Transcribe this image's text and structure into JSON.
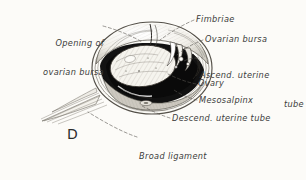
{
  "figure": {
    "letter": "D",
    "caption_subject": "ovarian bursa dissection",
    "background_color": "#fcfbf8",
    "ink_color": "#3b3b3b",
    "leader_style": "dashed"
  },
  "labels": {
    "opening_of_ovarian_bursa": {
      "line1": "Opening of",
      "line2": "ovarian bursa"
    },
    "fimbriae": "Fimbriae",
    "ovarian_bursa": "Ovarian bursa",
    "ascend_uterine_tube": {
      "line1": "Ascend. uterine",
      "line2": "tube"
    },
    "ovary": "Ovary",
    "mesosalpinx": "Mesosalpinx",
    "descend_uterine_tube": "Descend. uterine tube",
    "broad_ligament": {
      "line1": "Broad ligament",
      "line2": "(mesovarium)"
    }
  },
  "structures": [
    {
      "name": "ovary",
      "appearance": "pale hatched oval"
    },
    {
      "name": "ovarian-bursa-cavity",
      "appearance": "solid black crescent"
    },
    {
      "name": "fimbriae",
      "appearance": "fringed folds at bursa opening"
    },
    {
      "name": "broad-ligament-sheet",
      "appearance": "layered parallel membrane"
    },
    {
      "name": "uterine-tube",
      "appearance": "coiled tube in bursa wall"
    }
  ]
}
